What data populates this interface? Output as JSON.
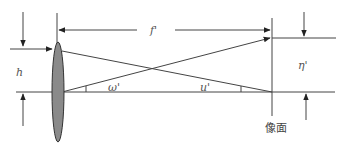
{
  "diagram": {
    "title": "",
    "labels": {
      "focal_length": "f'",
      "height": "h",
      "field_angle": "ω'",
      "aperture_angle": "u'",
      "image_height": "η'",
      "image_plane": "像面"
    },
    "colors": {
      "line": "#444444",
      "lens_fill": "#8a8a8a",
      "lens_stroke": "#333333",
      "text": "#555555"
    }
  }
}
